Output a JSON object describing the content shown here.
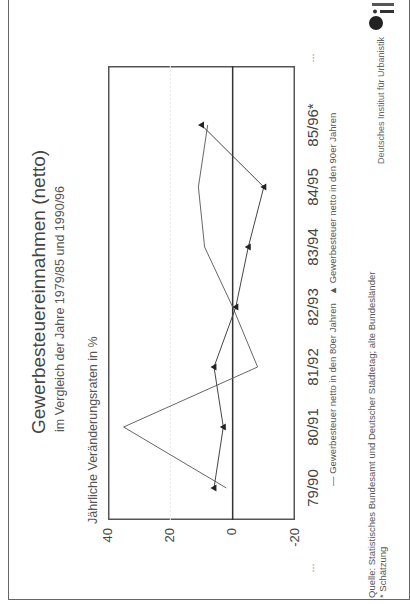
{
  "title": "Gewerbesteuereinnahmen (netto)",
  "subtitle": "im Vergleich der Jahre 1979/85 und 1990/96",
  "y_axis_label": "Jährliche Veränderungsraten in %",
  "legend": {
    "series_80s": "— Gewerbesteuer netto in den 80er Jahren",
    "series_90s": "▲ Gewerbesteuer netto in den 90er Jahren"
  },
  "source": "Quelle: Statistisches Bundesamt und Deutscher Städtetag; alte Bundesländer",
  "footnote": "* Schätzung",
  "credit": "Deutsches Institut für Urbanistik",
  "ellipsis_left": "...",
  "ellipsis_right": "...",
  "y_ticks": [
    "40",
    "20",
    "0",
    "-20"
  ],
  "x_ticks": [
    "79/90",
    "80/91",
    "81/92",
    "82/93",
    "83/94",
    "84/95",
    "85/96*"
  ],
  "chart_data": {
    "type": "line",
    "title": "Gewerbesteuereinnahmen (netto)",
    "subtitle": "im Vergleich der Jahre 1979/85 und 1990/96",
    "xlabel": "",
    "ylabel": "Jährliche Veränderungsraten in %",
    "categories": [
      "79/90",
      "80/91",
      "81/92",
      "82/93",
      "83/94",
      "84/95",
      "85/96*"
    ],
    "series": [
      {
        "name": "Gewerbesteuer netto in den 80er Jahren",
        "marker": "none",
        "values": [
          2,
          35,
          -8,
          0,
          9,
          11,
          8
        ]
      },
      {
        "name": "Gewerbesteuer netto in den 90er Jahren",
        "marker": "triangle",
        "values": [
          6,
          3,
          6,
          -1,
          -5,
          -10,
          10
        ]
      }
    ],
    "ylim": [
      -20,
      40
    ],
    "yticks": [
      40,
      20,
      0,
      -20
    ],
    "grid": true,
    "legend_position": "bottom",
    "orientation": "rotated 90° counterclockwise",
    "annotations": [
      "* Schätzung"
    ]
  }
}
